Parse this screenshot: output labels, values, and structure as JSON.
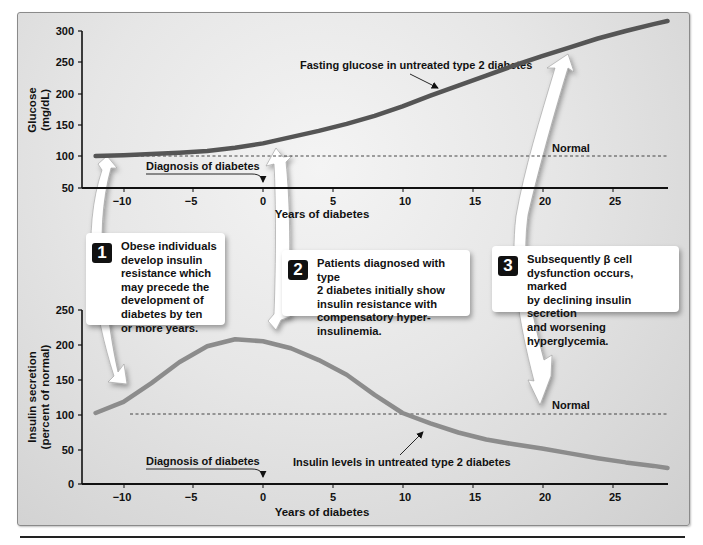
{
  "chart_data": [
    {
      "type": "line",
      "title": "Fasting glucose in untreated type 2 diabetes",
      "xlabel": "Years of diabetes",
      "ylabel": "Glucose (mg/dL)",
      "xlim": [
        -12.5,
        29.5
      ],
      "ylim": [
        50,
        300
      ],
      "xticks": [
        -10,
        -5,
        0,
        5,
        10,
        15,
        20,
        25
      ],
      "xtick_labels": [
        "−10",
        "−5",
        "0",
        "5",
        "10",
        "15",
        "20",
        "25"
      ],
      "yticks": [
        50,
        100,
        150,
        200,
        250,
        300
      ],
      "grid": false,
      "series": [
        {
          "name": "Fasting glucose in untreated type 2 diabetes",
          "x": [
            -12,
            -10,
            -8,
            -6,
            -4,
            -2,
            0,
            2,
            4,
            6,
            8,
            10,
            12,
            14,
            16,
            18,
            20,
            22,
            24,
            26,
            28,
            29
          ],
          "values": [
            101,
            102,
            104,
            106,
            109,
            114,
            121,
            131,
            141,
            152,
            165,
            180,
            197,
            213,
            229,
            245,
            260,
            274,
            288,
            300,
            311,
            316
          ]
        }
      ],
      "reference_lines": [
        {
          "label": "Normal",
          "y": 100,
          "style": "dashed",
          "x_from": -9.5,
          "x_to": 29
        }
      ],
      "annotations": [
        {
          "text": "Fasting glucose in untreated type 2 diabetes",
          "arrow_to": [
            12.5,
            200
          ]
        },
        {
          "text": "Diagnosis of diabetes",
          "arrow_to": [
            0,
            50
          ]
        },
        {
          "text": "Normal",
          "at": [
            21,
            100
          ]
        }
      ]
    },
    {
      "type": "line",
      "title": "Insulin levels in untreated type 2 diabetes",
      "xlabel": "Years of diabetes",
      "ylabel": "Insulin secretion (percent of normal)",
      "xlim": [
        -12.5,
        29.5
      ],
      "ylim": [
        0,
        250
      ],
      "xticks": [
        -10,
        -5,
        0,
        5,
        10,
        15,
        20,
        25
      ],
      "xtick_labels": [
        "−10",
        "−5",
        "0",
        "5",
        "10",
        "15",
        "20",
        "25"
      ],
      "yticks": [
        0,
        50,
        100,
        150,
        200,
        250
      ],
      "grid": false,
      "series": [
        {
          "name": "Insulin levels in untreated type 2 diabetes",
          "x": [
            -12,
            -10,
            -8,
            -6,
            -4,
            -2,
            0,
            2,
            4,
            6,
            8,
            10,
            12,
            14,
            16,
            18,
            20,
            22,
            24,
            26,
            28,
            29
          ],
          "values": [
            102,
            118,
            145,
            175,
            198,
            208,
            205,
            195,
            178,
            157,
            128,
            102,
            87,
            74,
            64,
            57,
            51,
            44,
            37,
            31,
            26,
            23
          ]
        }
      ],
      "reference_lines": [
        {
          "label": "Normal",
          "y": 100,
          "style": "dashed",
          "x_from": -9.5,
          "x_to": 29
        }
      ],
      "annotations": [
        {
          "text": "Insulin levels in untreated type 2 diabetes",
          "arrow_to": [
            11.5,
            90
          ]
        },
        {
          "text": "Diagnosis of diabetes",
          "arrow_to": [
            0,
            0
          ]
        },
        {
          "text": "Normal",
          "at": [
            21,
            100
          ]
        }
      ]
    }
  ],
  "glucose_panel": {
    "ylabel_line1": "Glucose",
    "ylabel_line2": "(mg/dL)",
    "yticks": [
      "300",
      "250",
      "200",
      "150",
      "100",
      "50"
    ],
    "xticks": [
      "−10",
      "−5",
      "0",
      "5",
      "10",
      "15",
      "20",
      "25"
    ],
    "xlabel": "Years of diabetes",
    "curve_label": "Fasting glucose in untreated type 2 diabetes",
    "diagnosis_label": "Diagnosis of diabetes",
    "normal_label": "Normal"
  },
  "insulin_panel": {
    "ylabel_line1": "Insulin secretion",
    "ylabel_line2": "(percent of normal)",
    "yticks": [
      "250",
      "200",
      "150",
      "100",
      "50",
      "0"
    ],
    "xticks": [
      "−10",
      "−5",
      "0",
      "5",
      "10",
      "15",
      "20",
      "25"
    ],
    "xlabel": "Years of diabetes",
    "curve_label": "Insulin levels in untreated type 2 diabetes",
    "diagnosis_label": "Diagnosis of diabetes",
    "normal_label": "Normal"
  },
  "callouts": [
    {
      "number": "1",
      "text": "Obese individuals\ndevelop insulin\nresistance which\nmay precede the\ndevelopment of\ndiabetes by ten\nor more years."
    },
    {
      "number": "2",
      "text": "Patients diagnosed with type\n2 diabetes initially show\ninsulin resistance with\ncompensatory hyper-\ninsulinemia."
    },
    {
      "number": "3",
      "text": "Subsequently β cell\ndysfunction occurs, marked\nby declining insulin secretion\nand worsening hyperglycemia."
    }
  ],
  "colors": {
    "glucose_curve": "#555555",
    "insulin_curve": "#8c8c8c",
    "axis": "#111111",
    "panel_bg": "#e6e6e6"
  }
}
